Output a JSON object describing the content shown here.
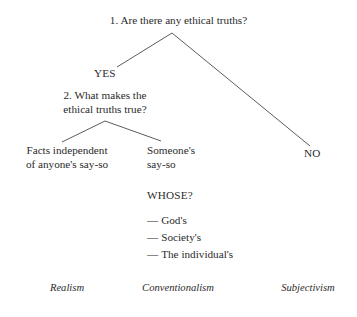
{
  "diagram": {
    "line_color": "#4a4a4a",
    "text_color": "#2b2b2b",
    "background": "#ffffff"
  },
  "questions": {
    "root": "1. Are there any ethical truths?",
    "second": "2. What makes the\nethical truths true?"
  },
  "branch_labels": {
    "yes": "YES",
    "no": "NO"
  },
  "leaves": {
    "left": "Facts independent\nof anyone's say-so",
    "middle": "Someone's\nsay-so"
  },
  "whose": {
    "heading": "WHOSE?",
    "dash": "—",
    "items": [
      "God's",
      "Society's",
      "The individual's"
    ]
  },
  "terms": [
    "Realism",
    "Conventionalism",
    "Subjectivism"
  ],
  "edges": [
    {
      "name": "root-to-yes",
      "x1": 172,
      "y1": 33,
      "x2": 117,
      "y2": 67
    },
    {
      "name": "root-to-no",
      "x1": 172,
      "y1": 33,
      "x2": 310,
      "y2": 146
    },
    {
      "name": "second-to-left",
      "x1": 105,
      "y1": 121,
      "x2": 62,
      "y2": 142
    },
    {
      "name": "second-to-middle",
      "x1": 105,
      "y1": 121,
      "x2": 161,
      "y2": 141
    }
  ]
}
